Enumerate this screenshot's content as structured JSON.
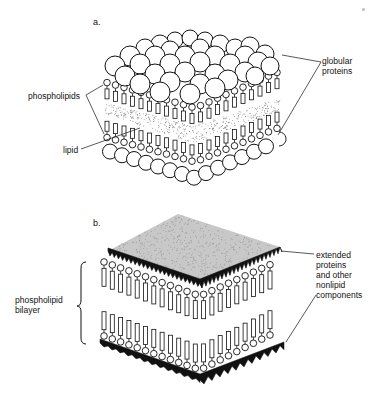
{
  "figure": {
    "panel_a": {
      "letter": "a.",
      "labels": {
        "globular_proteins_line1": "globular",
        "globular_proteins_line2": "proteins",
        "phospholipids": "phospholipids",
        "lipid": "lipid"
      }
    },
    "panel_b": {
      "letter": "b.",
      "labels": {
        "bilayer_line1": "phospholipid",
        "bilayer_line2": "bilayer",
        "extended_line1": "extended",
        "extended_line2": "proteins",
        "extended_line3": "and other",
        "extended_line4": "nonlipid",
        "extended_line5": "components"
      }
    }
  },
  "colors": {
    "ink": "#111111",
    "surface_gray": "#c8c8c8",
    "background": "#ffffff"
  }
}
